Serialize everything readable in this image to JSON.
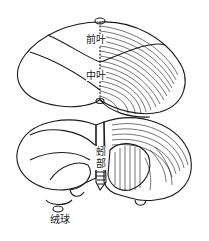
{
  "diagram": {
    "labels": {
      "anterior_lobe": "前叶",
      "middle_lobe": "中叶",
      "vermis": "蚓部",
      "flocculus": "绒球"
    },
    "colors": {
      "line": "#1a1a1a",
      "background": "#ffffff"
    }
  }
}
